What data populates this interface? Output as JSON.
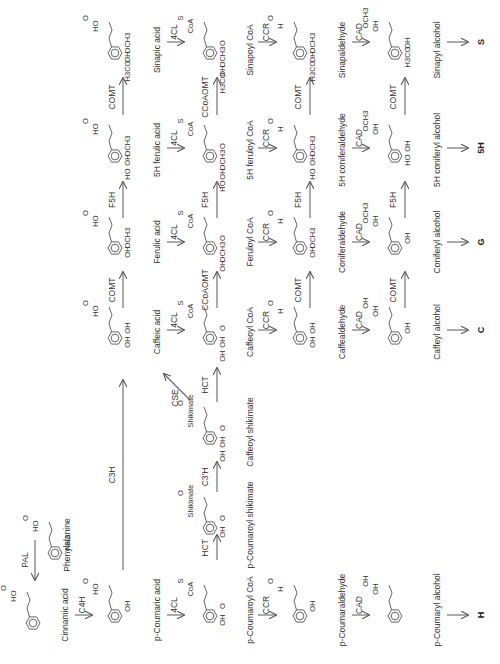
{
  "colors": {
    "line": "#666666",
    "text": "#333333"
  },
  "compounds": [
    {
      "id": "phenylalanine",
      "label": "Phenylalanine",
      "x": 40,
      "y": 545,
      "lx": 70,
      "ly": 545,
      "subs": [
        "HO",
        "O",
        "NH2"
      ],
      "type": "aa"
    },
    {
      "id": "cinnamic-acid",
      "label": "Cinnamic acid",
      "x": 18,
      "y": 615,
      "lx": 68,
      "ly": 615,
      "subs": [
        "HO",
        "O"
      ],
      "type": "acid0"
    },
    {
      "id": "p-coumaric-acid",
      "label": "p-Coumaric acid",
      "x": 100,
      "y": 608,
      "lx": 160,
      "ly": 610,
      "subs": [
        "HO",
        "O",
        "OH"
      ],
      "type": "acid1"
    },
    {
      "id": "p-coumaroyl-coa",
      "label": "p-Coumaroyl CoA",
      "x": 195,
      "y": 608,
      "lx": 253,
      "ly": 610,
      "subs": [
        "CoA",
        "S",
        "O",
        "OH"
      ],
      "type": "coa1"
    },
    {
      "id": "p-coumaraldehyde",
      "label": "p-Coumaraldehyde",
      "x": 285,
      "y": 608,
      "lx": 345,
      "ly": 610,
      "subs": [
        "H",
        "O",
        "OH"
      ],
      "type": "ald1"
    },
    {
      "id": "p-coumaryl-alcohol",
      "label": "p-Coumaryl alcohol",
      "x": 380,
      "y": 608,
      "lx": 440,
      "ly": 610,
      "subs": [
        "OH",
        "OH"
      ],
      "type": "alc1"
    },
    {
      "id": "p-coumaroyl-shikimate",
      "label": "p-Coumaroyl shikimate",
      "x": 195,
      "y": 520,
      "lx": 253,
      "ly": 525,
      "subs": [
        "Shikimate",
        "O",
        "O",
        "OH"
      ],
      "type": "shk1"
    },
    {
      "id": "caffeoyl-shikimate",
      "label": "Caffeoyl shikimate",
      "x": 195,
      "y": 430,
      "lx": 253,
      "ly": 432,
      "subs": [
        "Shikimate",
        "O",
        "O",
        "OH",
        "OH"
      ],
      "type": "shk2"
    },
    {
      "id": "caffeic-acid",
      "label": "Caffeic acid",
      "x": 100,
      "y": 330,
      "lx": 160,
      "ly": 332,
      "subs": [
        "HO",
        "O",
        "OH",
        "OH"
      ],
      "type": "acid2"
    },
    {
      "id": "caffeoyl-coa",
      "label": "Caffeoyl CoA",
      "x": 195,
      "y": 330,
      "lx": 253,
      "ly": 332,
      "subs": [
        "CoA",
        "S",
        "O",
        "OH",
        "OH"
      ],
      "type": "coa2"
    },
    {
      "id": "caffealdehyde",
      "label": "Caffealdehyde",
      "x": 285,
      "y": 330,
      "lx": 345,
      "ly": 332,
      "subs": [
        "H",
        "O",
        "OH",
        "OH"
      ],
      "type": "ald2"
    },
    {
      "id": "caffeyl-alcohol",
      "label": "Caffeyl alcohol",
      "x": 380,
      "y": 330,
      "lx": 440,
      "ly": 332,
      "subs": [
        "OH",
        "OH",
        "OH"
      ],
      "type": "alc2"
    },
    {
      "id": "ferulic-acid",
      "label": "Ferulic acid",
      "x": 100,
      "y": 240,
      "lx": 160,
      "ly": 242,
      "subs": [
        "HO",
        "O",
        "OCH3",
        "OH"
      ],
      "type": "acid3"
    },
    {
      "id": "feruloyl-coa",
      "label": "Feruloyl CoA",
      "x": 195,
      "y": 240,
      "lx": 253,
      "ly": 242,
      "subs": [
        "CoA",
        "S",
        "O",
        "OCH3",
        "OH"
      ],
      "type": "coa3"
    },
    {
      "id": "coniferaldehyde",
      "label": "Coniferaldehyde",
      "x": 285,
      "y": 240,
      "lx": 345,
      "ly": 242,
      "subs": [
        "H",
        "O",
        "OCH3",
        "OH"
      ],
      "type": "ald3"
    },
    {
      "id": "coniferyl-alcohol",
      "label": "Coniferyl alcohol",
      "x": 380,
      "y": 240,
      "lx": 440,
      "ly": 242,
      "subs": [
        "OH",
        "OCH3",
        "OH"
      ],
      "type": "alc3"
    },
    {
      "id": "5h-ferulic-acid",
      "label": "5H ferulic acid",
      "x": 100,
      "y": 148,
      "lx": 160,
      "ly": 150,
      "subs": [
        "HO",
        "O",
        "OCH3",
        "OH",
        "HO"
      ],
      "type": "acid4"
    },
    {
      "id": "5h-feruloyl-coa",
      "label": "5H feruloyl CoA",
      "x": 195,
      "y": 148,
      "lx": 253,
      "ly": 150,
      "subs": [
        "CoA",
        "S",
        "O",
        "OCH3",
        "OH",
        "HO"
      ],
      "type": "coa4"
    },
    {
      "id": "5h-coniferaldehyde",
      "label": "5H coniferaldehyde",
      "x": 285,
      "y": 148,
      "lx": 345,
      "ly": 150,
      "subs": [
        "H",
        "O",
        "OCH3",
        "OH",
        "HO"
      ],
      "type": "ald4"
    },
    {
      "id": "5h-coniferyl-alcohol",
      "label": "5H coniferyl alcohol",
      "x": 380,
      "y": 148,
      "lx": 440,
      "ly": 150,
      "subs": [
        "OH",
        "OCH3",
        "OH",
        "HO"
      ],
      "type": "alc4"
    },
    {
      "id": "sinapic-acid",
      "label": "Sinapic acid",
      "x": 100,
      "y": 45,
      "lx": 160,
      "ly": 50,
      "subs": [
        "HO",
        "O",
        "OCH3",
        "OH",
        "H3CO"
      ],
      "type": "acid5"
    },
    {
      "id": "sinapoyl-coa",
      "label": "Sinapoyl CoA",
      "x": 195,
      "y": 45,
      "lx": 253,
      "ly": 50,
      "subs": [
        "CoA",
        "S",
        "O",
        "OCH3",
        "OH",
        "H3CO"
      ],
      "type": "coa5"
    },
    {
      "id": "sinapaldehyde",
      "label": "Sinapaldehyde",
      "x": 285,
      "y": 45,
      "lx": 345,
      "ly": 50,
      "subs": [
        "H",
        "O",
        "OCH3",
        "OH",
        "H3CO"
      ],
      "type": "ald5"
    },
    {
      "id": "sinapyl-alcohol",
      "label": "Sinapyl alcohol",
      "x": 380,
      "y": 45,
      "lx": 440,
      "ly": 50,
      "subs": [
        "OH",
        "OCH3",
        "OH",
        "H3CO"
      ],
      "type": "alc5"
    }
  ],
  "arrows": [
    {
      "enzyme": "PAL",
      "x1": 35,
      "y1": 540,
      "x2": 35,
      "y2": 580,
      "dir": "down",
      "lx": 28,
      "ly": 560
    },
    {
      "enzyme": "C4H",
      "x1": 75,
      "y1": 615,
      "x2": 92,
      "y2": 615,
      "dir": "right",
      "lx": 85,
      "ly": 605
    },
    {
      "enzyme": "4CL",
      "x1": 167,
      "y1": 615,
      "x2": 184,
      "y2": 615,
      "dir": "right",
      "lx": 177,
      "ly": 605
    },
    {
      "enzyme": "CCR",
      "x1": 258,
      "y1": 615,
      "x2": 276,
      "y2": 615,
      "dir": "right",
      "lx": 269,
      "ly": 605
    },
    {
      "enzyme": "CAD",
      "x1": 352,
      "y1": 615,
      "x2": 369,
      "y2": 615,
      "dir": "right",
      "lx": 362,
      "ly": 605
    },
    {
      "enzyme": "",
      "x1": 447,
      "y1": 615,
      "x2": 468,
      "y2": 615,
      "dir": "right",
      "lx": 0,
      "ly": 0
    },
    {
      "enzyme": "HCT",
      "x1": 217,
      "y1": 560,
      "x2": 217,
      "y2": 535,
      "dir": "up",
      "lx": 208,
      "ly": 548
    },
    {
      "enzyme": "C3'H",
      "x1": 217,
      "y1": 492,
      "x2": 217,
      "y2": 462,
      "dir": "up",
      "lx": 208,
      "ly": 477
    },
    {
      "enzyme": "HCT",
      "x1": 217,
      "y1": 402,
      "x2": 217,
      "y2": 368,
      "dir": "up",
      "lx": 208,
      "ly": 385
    },
    {
      "enzyme": "CSE",
      "x1": 190,
      "y1": 400,
      "x2": 164,
      "y2": 374,
      "dir": "diag",
      "lx": 178,
      "ly": 398
    },
    {
      "enzyme": "C3H",
      "x1": 123,
      "y1": 570,
      "x2": 123,
      "y2": 380,
      "dir": "up",
      "lx": 115,
      "ly": 475
    },
    {
      "enzyme": "4CL",
      "x1": 167,
      "y1": 330,
      "x2": 184,
      "y2": 330,
      "dir": "right",
      "lx": 177,
      "ly": 320
    },
    {
      "enzyme": "CCR",
      "x1": 258,
      "y1": 330,
      "x2": 276,
      "y2": 330,
      "dir": "right",
      "lx": 269,
      "ly": 320
    },
    {
      "enzyme": "CAD",
      "x1": 352,
      "y1": 330,
      "x2": 369,
      "y2": 330,
      "dir": "right",
      "lx": 362,
      "ly": 320
    },
    {
      "enzyme": "",
      "x1": 447,
      "y1": 330,
      "x2": 468,
      "y2": 330,
      "dir": "right",
      "lx": 0,
      "ly": 0
    },
    {
      "enzyme": "COMT",
      "x1": 123,
      "y1": 308,
      "x2": 123,
      "y2": 272,
      "dir": "up",
      "lx": 115,
      "ly": 290
    },
    {
      "enzyme": "CCoAOMT",
      "x1": 217,
      "y1": 308,
      "x2": 217,
      "y2": 272,
      "dir": "up",
      "lx": 208,
      "ly": 290
    },
    {
      "enzyme": "COMT",
      "x1": 310,
      "y1": 308,
      "x2": 310,
      "y2": 272,
      "dir": "up",
      "lx": 301,
      "ly": 290
    },
    {
      "enzyme": "COMT",
      "x1": 405,
      "y1": 308,
      "x2": 405,
      "y2": 272,
      "dir": "up",
      "lx": 396,
      "ly": 290
    },
    {
      "enzyme": "4CL",
      "x1": 167,
      "y1": 242,
      "x2": 184,
      "y2": 242,
      "dir": "right",
      "lx": 177,
      "ly": 232
    },
    {
      "enzyme": "CCR",
      "x1": 258,
      "y1": 242,
      "x2": 276,
      "y2": 242,
      "dir": "right",
      "lx": 269,
      "ly": 232
    },
    {
      "enzyme": "CAD",
      "x1": 352,
      "y1": 242,
      "x2": 369,
      "y2": 242,
      "dir": "right",
      "lx": 362,
      "ly": 232
    },
    {
      "enzyme": "",
      "x1": 447,
      "y1": 242,
      "x2": 468,
      "y2": 242,
      "dir": "right",
      "lx": 0,
      "ly": 0
    },
    {
      "enzyme": "F5H",
      "x1": 123,
      "y1": 218,
      "x2": 123,
      "y2": 182,
      "dir": "up",
      "lx": 115,
      "ly": 200
    },
    {
      "enzyme": "F5H",
      "x1": 217,
      "y1": 218,
      "x2": 217,
      "y2": 182,
      "dir": "up",
      "lx": 208,
      "ly": 200
    },
    {
      "enzyme": "F5H",
      "x1": 310,
      "y1": 218,
      "x2": 310,
      "y2": 182,
      "dir": "up",
      "lx": 301,
      "ly": 200
    },
    {
      "enzyme": "F5H",
      "x1": 405,
      "y1": 218,
      "x2": 405,
      "y2": 182,
      "dir": "up",
      "lx": 396,
      "ly": 200
    },
    {
      "enzyme": "4CL",
      "x1": 167,
      "y1": 148,
      "x2": 184,
      "y2": 148,
      "dir": "right",
      "lx": 177,
      "ly": 138
    },
    {
      "enzyme": "CCR",
      "x1": 258,
      "y1": 148,
      "x2": 276,
      "y2": 148,
      "dir": "right",
      "lx": 269,
      "ly": 138
    },
    {
      "enzyme": "CAD",
      "x1": 352,
      "y1": 148,
      "x2": 369,
      "y2": 148,
      "dir": "right",
      "lx": 362,
      "ly": 138
    },
    {
      "enzyme": "",
      "x1": 447,
      "y1": 148,
      "x2": 468,
      "y2": 148,
      "dir": "right",
      "lx": 0,
      "ly": 0
    },
    {
      "enzyme": "COMT",
      "x1": 123,
      "y1": 115,
      "x2": 123,
      "y2": 78,
      "dir": "up",
      "lx": 115,
      "ly": 97
    },
    {
      "enzyme": "CCoAOMT",
      "x1": 217,
      "y1": 115,
      "x2": 217,
      "y2": 78,
      "dir": "up",
      "lx": 208,
      "ly": 97
    },
    {
      "enzyme": "COMT",
      "x1": 310,
      "y1": 115,
      "x2": 310,
      "y2": 78,
      "dir": "up",
      "lx": 301,
      "ly": 97
    },
    {
      "enzyme": "COMT",
      "x1": 405,
      "y1": 115,
      "x2": 405,
      "y2": 78,
      "dir": "up",
      "lx": 396,
      "ly": 97
    },
    {
      "enzyme": "4CL",
      "x1": 167,
      "y1": 42,
      "x2": 184,
      "y2": 42,
      "dir": "right",
      "lx": 177,
      "ly": 32
    },
    {
      "enzyme": "CCR",
      "x1": 258,
      "y1": 42,
      "x2": 276,
      "y2": 42,
      "dir": "right",
      "lx": 269,
      "ly": 32
    },
    {
      "enzyme": "CAD",
      "x1": 352,
      "y1": 42,
      "x2": 369,
      "y2": 42,
      "dir": "right",
      "lx": 362,
      "ly": 32
    },
    {
      "enzyme": "",
      "x1": 447,
      "y1": 42,
      "x2": 468,
      "y2": 42,
      "dir": "right",
      "lx": 0,
      "ly": 0
    }
  ],
  "lignin_units": [
    {
      "label": "S",
      "x": 484,
      "y": 42
    },
    {
      "label": "5H",
      "x": 484,
      "y": 148
    },
    {
      "label": "G",
      "x": 484,
      "y": 242
    },
    {
      "label": "C",
      "x": 484,
      "y": 330
    },
    {
      "label": "H",
      "x": 484,
      "y": 615
    }
  ]
}
